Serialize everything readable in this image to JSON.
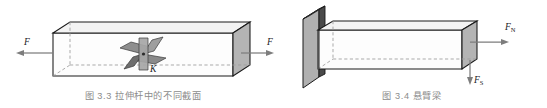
{
  "page": {
    "background": "#ffffff",
    "width": 547,
    "height": 108,
    "kind": "textbook-figure-pair"
  },
  "palette": {
    "stroke": "#1a1a1a",
    "end_face_gray": "#b4b4b4",
    "top_face": "#f2f2f2",
    "front_face": "#fdfdfd",
    "wall_face": "#b0b0b0",
    "wall_edge_dark": "#4a4a4a",
    "blade_gray": "#9a9a9a",
    "blade_dark": "#6e6e6e",
    "arrow_gray": "#7d7d7d",
    "dashed_gray": "#9b9b9b",
    "caption_gray": "#8c8c8c",
    "label_black": "#1a1a1a"
  },
  "figures": [
    {
      "id": "figure-3-3",
      "caption": "图 3.3   拉伸杆中的不同截面",
      "caption_number": "图 3.3",
      "caption_title": "拉伸杆中的不同截面",
      "subject": "prismatic-bar-in-tension",
      "labels": [
        {
          "name": "force-left",
          "text": "F",
          "sub": "",
          "arrow": "left"
        },
        {
          "name": "force-right",
          "text": "F",
          "sub": "",
          "arrow": "right"
        },
        {
          "name": "section-point",
          "text": "K",
          "sub": "",
          "arrow": "none"
        }
      ],
      "elements": {
        "bar": "rectangular prism drawn in oblique projection, hidden edges dashed",
        "end_face": "gray shaded right end face",
        "section_pinwheel": "four inclined cross-section planes through point K"
      }
    },
    {
      "id": "figure-3-4",
      "caption": "图 3.4   悬臂梁",
      "caption_number": "图 3.4",
      "caption_title": "悬臂梁",
      "subject": "cantilever-beam-fixed-in-wall",
      "labels": [
        {
          "name": "axial-force",
          "text": "F",
          "sub": "N",
          "arrow": "right"
        },
        {
          "name": "shear-force",
          "text": "F",
          "sub": "S",
          "arrow": "down"
        }
      ],
      "elements": {
        "wall": "vertical support plate, beam built in",
        "beam": "rectangular prism cantilevered to the right, hidden edges dashed",
        "free_end_face": "gray shaded right end face"
      }
    }
  ]
}
